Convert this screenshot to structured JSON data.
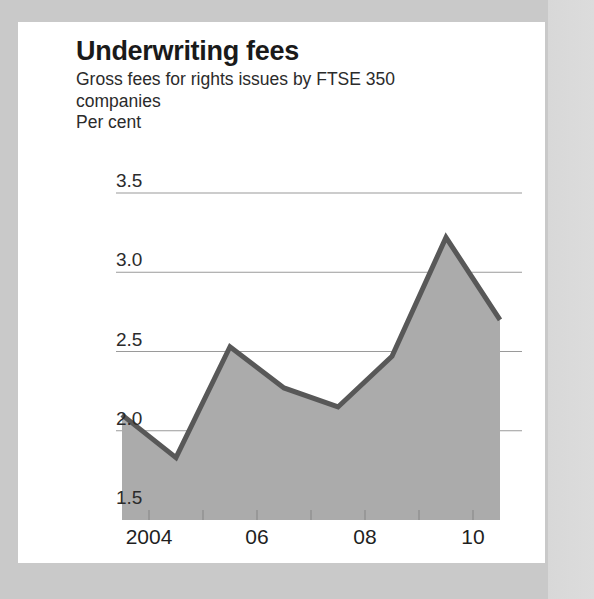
{
  "header": {
    "title": "Underwriting fees",
    "subtitle": "Gross fees for rights issues by FTSE 350 companies",
    "unit": "Per cent"
  },
  "colors": {
    "page_background": "#c9c9c9",
    "card_background": "#ffffff",
    "area_fill": "#ababab",
    "line": "#585858",
    "gridline": "#9a9a9a",
    "text": "#1a1a1a"
  },
  "chart_data": {
    "type": "area",
    "title": "Underwriting fees",
    "subtitle": "Gross fees for rights issues by FTSE 350 companies",
    "xlabel": "",
    "ylabel": "Per cent",
    "x": [
      2003.5,
      2004.5,
      2005.5,
      2006.5,
      2007.5,
      2008.5,
      2009.5,
      2010.5
    ],
    "values": [
      2.1,
      1.83,
      2.53,
      2.27,
      2.15,
      2.47,
      3.22,
      2.7
    ],
    "series": [
      {
        "name": "Gross underwriting fees",
        "values": [
          2.1,
          1.83,
          2.53,
          2.27,
          2.15,
          2.47,
          3.22,
          2.7
        ]
      }
    ],
    "ylim": [
      1.5,
      3.5
    ],
    "xlim": [
      2003.5,
      2010.5
    ],
    "yticks": [
      1.5,
      2.0,
      2.5,
      3.0,
      3.5
    ],
    "ytick_labels": [
      "1.5",
      "2.0",
      "2.5",
      "3.0",
      "3.5"
    ],
    "xticks": [
      2004,
      2006,
      2008,
      2010
    ],
    "xtick_labels": [
      "2004",
      "06",
      "08",
      "10"
    ],
    "grid": true,
    "legend": false,
    "legend_position": "none"
  }
}
